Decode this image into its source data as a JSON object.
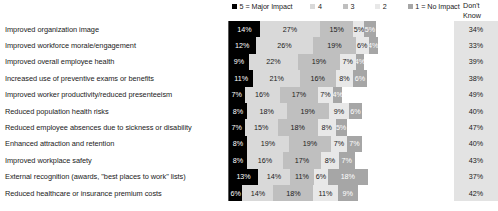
{
  "legend": {
    "items": [
      {
        "label": "5 = Major Impact",
        "color": "#000000",
        "key": "r5"
      },
      {
        "label": "4",
        "color": "#d9d9d9",
        "key": "r4"
      },
      {
        "label": "3",
        "color": "#bfbfbf",
        "key": "r3"
      },
      {
        "label": "2",
        "color": "#e8e8e8",
        "key": "r2"
      },
      {
        "label": "1 = No Impact",
        "color": "#a6a6a6",
        "key": "r1"
      }
    ],
    "dont_know_header": "Don't\nKnow",
    "dont_know_header_line1": "Don't",
    "dont_know_header_line2": "Know"
  },
  "chart_data": {
    "type": "bar",
    "orientation": "horizontal",
    "stacked": true,
    "title": "",
    "xlabel": "",
    "ylabel": "",
    "grid": false,
    "legend_position": "top",
    "value_suffix": "%",
    "series": [
      {
        "name": "5 = Major Impact",
        "color": "#000000",
        "values": [
          14,
          12,
          9,
          11,
          7,
          8,
          7,
          8,
          8,
          13,
          6
        ]
      },
      {
        "name": "4",
        "color": "#d9d9d9",
        "values": [
          27,
          26,
          22,
          21,
          16,
          18,
          15,
          19,
          16,
          14,
          14
        ]
      },
      {
        "name": "3",
        "color": "#bfbfbf",
        "values": [
          15,
          19,
          19,
          16,
          17,
          19,
          18,
          19,
          17,
          11,
          18
        ]
      },
      {
        "name": "2",
        "color": "#e8e8e8",
        "values": [
          5,
          6,
          7,
          8,
          7,
          9,
          8,
          7,
          8,
          6,
          11
        ]
      },
      {
        "name": "1 = No Impact",
        "color": "#a6a6a6",
        "values": [
          5,
          4,
          4,
          6,
          4,
          6,
          5,
          7,
          7,
          18,
          9
        ]
      }
    ],
    "dont_know": {
      "name": "Don't Know",
      "values": [
        34,
        33,
        39,
        38,
        49,
        40,
        47,
        40,
        43,
        37,
        42
      ]
    },
    "categories": [
      "Improved organization image",
      "Improved workforce morale/engagement",
      "Improved overall employee health",
      "Increased use of preventive exams or benefits",
      "Improved worker productivity/reduced presenteeism",
      "Reduced population health risks",
      "Reduced employee absences due to sickness or disability",
      "Enhanced attraction and retention",
      "Improved workplace safety",
      "External recognition (awards, \"best places to work\" lists)",
      "Reduced healthcare or insurance premium costs"
    ]
  }
}
